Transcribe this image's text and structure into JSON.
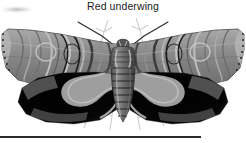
{
  "figure": {
    "caption": "Red underwing",
    "rendering": "grayscale-illustration",
    "rule_visible": true
  },
  "palette": {
    "background": "#ffffff",
    "caption_text": "#1a1a1a",
    "rule": "#2b2b2b",
    "forewing_light": "#b9b9b9",
    "forewing_mid": "#8d8d8d",
    "forewing_dark": "#5a5a5a",
    "forewing_line": "#1c1c1c",
    "hindwing_black": "#0a0a0a",
    "hindwing_band": "#9a9a9a",
    "body_mid": "#6f6f6f",
    "body_dark": "#3a3a3a",
    "twig": "#c9c9c9",
    "antenna": "#2a2a2a"
  },
  "anatomy": {
    "parts": [
      {
        "name": "left-forewing",
        "label": "Left forewing"
      },
      {
        "name": "right-forewing",
        "label": "Right forewing"
      },
      {
        "name": "left-hindwing",
        "label": "Left hindwing"
      },
      {
        "name": "right-hindwing",
        "label": "Right hindwing"
      },
      {
        "name": "thorax",
        "label": "Thorax"
      },
      {
        "name": "abdomen",
        "label": "Abdomen"
      },
      {
        "name": "head",
        "label": "Head"
      },
      {
        "name": "left-antenna",
        "label": "Left antenna"
      },
      {
        "name": "right-antenna",
        "label": "Right antenna"
      }
    ],
    "abdomen_segments": 7
  },
  "background": {
    "twig_count": 7,
    "smudge_visible": true
  }
}
